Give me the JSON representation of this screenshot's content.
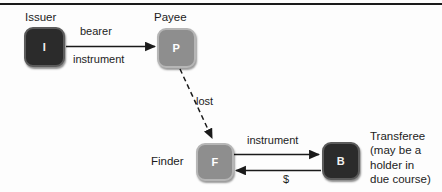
{
  "diagram": {
    "background": "#fdfdfd",
    "ink": "#1a1a1a",
    "node_dark_fill": "#2b2b2b",
    "node_mid_fill": "#8e8e8e",
    "nodes": [
      {
        "id": "issuer",
        "glyph": "I",
        "caption": "Issuer",
        "style": "dark"
      },
      {
        "id": "payee",
        "glyph": "P",
        "caption": "Payee",
        "style": "mid"
      },
      {
        "id": "finder",
        "glyph": "F",
        "caption": "Finder",
        "style": "mid"
      },
      {
        "id": "transferee",
        "glyph": "B",
        "caption": "Transferee\n(may be a\nholder in\ndue course)",
        "style": "dark"
      }
    ],
    "edges": [
      {
        "id": "issuer-to-payee",
        "from": "issuer",
        "to": "payee",
        "label_line1": "bearer",
        "label_line2": "instrument",
        "kind": "solid"
      },
      {
        "id": "payee-to-finder",
        "from": "payee",
        "to": "finder",
        "label_line1": "lost",
        "kind": "dashed"
      },
      {
        "id": "finder-to-transferee",
        "from": "finder",
        "to": "transferee",
        "label_line1": "instrument",
        "kind": "solid"
      },
      {
        "id": "transferee-to-finder",
        "from": "transferee",
        "to": "finder",
        "label_line1": "$",
        "kind": "solid"
      }
    ]
  }
}
